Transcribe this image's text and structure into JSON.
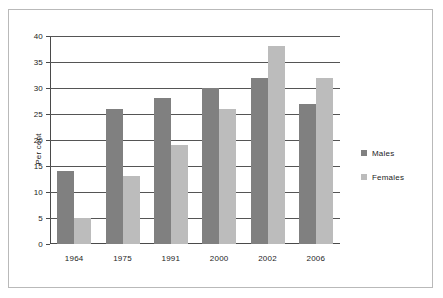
{
  "chart_data": {
    "type": "bar",
    "title": "",
    "xlabel": "",
    "ylabel": "Per cent",
    "categories": [
      "1964",
      "1975",
      "1991",
      "2000",
      "2002",
      "2006"
    ],
    "series": [
      {
        "name": "Males",
        "color": "#808080",
        "values": [
          14,
          26,
          28,
          30,
          32,
          27
        ]
      },
      {
        "name": "Females",
        "color": "#bcbcbc",
        "values": [
          5,
          13,
          19,
          26,
          38,
          32
        ]
      }
    ],
    "ylim": [
      0,
      40
    ],
    "yticks": [
      0,
      5,
      10,
      15,
      20,
      25,
      30,
      35,
      40
    ],
    "ytick_labels": [
      "0",
      "5",
      "10",
      "15",
      "20",
      "25",
      "30",
      "35",
      "40"
    ],
    "grid": true,
    "legend_position": "right"
  },
  "legend": {
    "entries": [
      {
        "label": "Males",
        "color": "#808080"
      },
      {
        "label": "Females",
        "color": "#bcbcbc"
      }
    ]
  }
}
